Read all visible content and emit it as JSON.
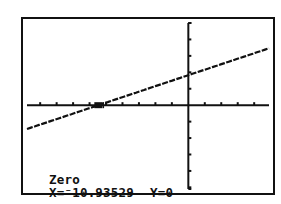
{
  "device": "graphing-calculator",
  "screen": {
    "mode_label": "Zero",
    "x_readout": "X=⁻10.93529",
    "y_readout": "Y=0"
  },
  "chart_data": {
    "type": "line",
    "title": "",
    "xlabel": "",
    "ylabel": "",
    "xlim": [
      -19.6,
      9.8
    ],
    "ylim": [
      -10.2,
      10.0
    ],
    "xscl": 2,
    "yscl": 2,
    "grid": false,
    "series": [
      {
        "name": "Y1",
        "slope": 0.334,
        "intercept": 3.65
      }
    ],
    "annotations": [
      {
        "type": "cursor",
        "x": -10.93529,
        "y": 0,
        "text": "Zero"
      }
    ],
    "colors": {
      "ink": "#111111",
      "background": "#ffffff"
    }
  }
}
